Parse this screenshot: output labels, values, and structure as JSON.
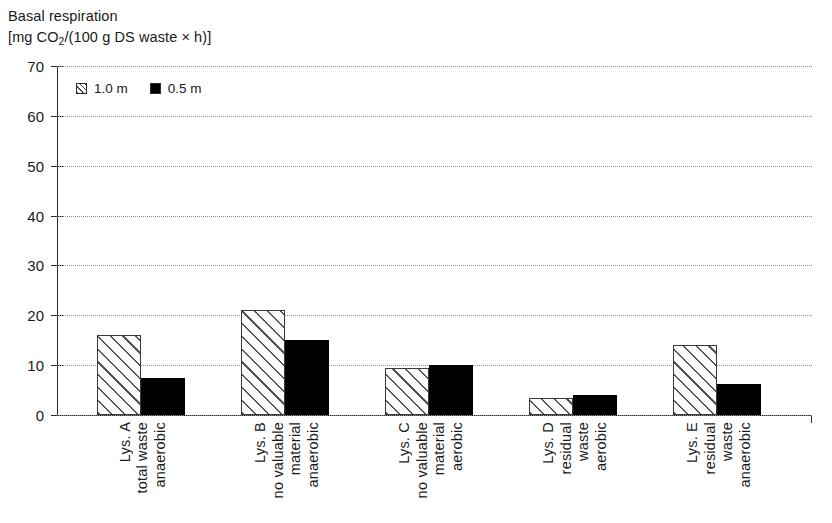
{
  "chart_data": {
    "type": "bar",
    "title": "Basal respiration",
    "subtitle": "[mg CO2/(100 g DS waste × h)]",
    "title_lines": [
      "Basal respiration",
      "[mg CO",
      "2",
      "/(100 g DS waste × h)]"
    ],
    "ylabel": "",
    "xlabel": "",
    "ylim": [
      0,
      70
    ],
    "yticks": [
      0,
      10,
      20,
      30,
      40,
      50,
      60,
      70
    ],
    "ytick_labels": [
      "0",
      "10",
      "20",
      "30",
      "40",
      "50",
      "60",
      "70"
    ],
    "grid": true,
    "grid_axis": "y",
    "grid_style": "dotted",
    "legend_position": "upper-left-inside",
    "categories": [
      "Lys. A total waste anaerobic",
      "Lys. B no valuable material anaerobic",
      "Lys. C no valuable material aerobic",
      "Lys. D residual waste aerobic",
      "Lys. E residual waste anaerobic"
    ],
    "category_lines": [
      [
        "Lys. A",
        "total waste",
        "anaerobic"
      ],
      [
        "Lys. B",
        "no valuable",
        "material",
        "anaerobic"
      ],
      [
        "Lys. C",
        "no valuable",
        "material",
        "aerobic"
      ],
      [
        "Lys. D",
        "residual",
        "waste",
        "aerobic"
      ],
      [
        "Lys. E",
        "residual",
        "waste",
        "anaerobic"
      ]
    ],
    "series": [
      {
        "name": "1.0 m",
        "pattern": "hatched",
        "color": "#ffffff",
        "values": [
          16,
          21,
          9.5,
          3.4,
          14
        ]
      },
      {
        "name": "0.5 m",
        "pattern": "solid",
        "color": "#000000",
        "values": [
          7.5,
          15,
          10,
          4,
          6.2
        ]
      }
    ]
  },
  "legend": {
    "entries": [
      {
        "label": "1.0 m",
        "swatch": "hatched"
      },
      {
        "label": "0.5 m",
        "swatch": "solid"
      }
    ]
  }
}
